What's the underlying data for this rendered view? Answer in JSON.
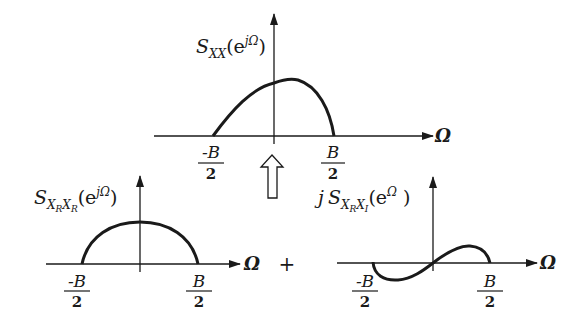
{
  "top_plot": {
    "ylabel_S": "S",
    "ylabel_sub": "XX",
    "ylabel_open": "(e",
    "ylabel_sup": "jΩ",
    "ylabel_close": ")",
    "xlabel": "Ω",
    "left_tick_num": "-B",
    "left_tick_den": "2",
    "right_tick_num": "B",
    "right_tick_den": "2"
  },
  "arrow": {
    "direction": "up",
    "style": "hollow"
  },
  "bottom_left_plot": {
    "ylabel_S": "S",
    "ylabel_sub1": "X",
    "ylabel_sub1_sub": "R",
    "ylabel_sub2": "X",
    "ylabel_sub2_sub": "R",
    "ylabel_open": "(e",
    "ylabel_sup": "jΩ",
    "ylabel_close": ")",
    "xlabel": "Ω",
    "left_tick_num": "-B",
    "left_tick_den": "2",
    "right_tick_num": "B",
    "right_tick_den": "2"
  },
  "plus_sign": "+",
  "bottom_right_plot": {
    "ylabel_j": "j",
    "ylabel_S": "S",
    "ylabel_sub1": "X",
    "ylabel_sub1_sub": "R",
    "ylabel_sub2": "X",
    "ylabel_sub2_sub": "I",
    "ylabel_open": "(e",
    "ylabel_sup": "Ω",
    "ylabel_close": ")",
    "xlabel": "Ω",
    "left_tick_num": "-B",
    "left_tick_den": "2",
    "right_tick_num": "B",
    "right_tick_den": "2"
  },
  "colors": {
    "ink": "#1a1a1a",
    "background": "#ffffff"
  }
}
